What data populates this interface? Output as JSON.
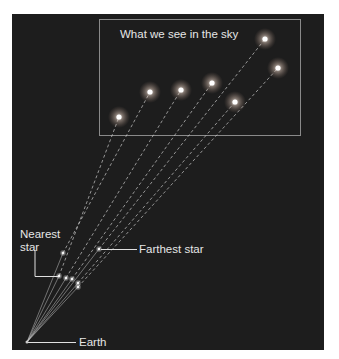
{
  "title": "What we see in the sky",
  "labels": {
    "nearest": [
      "Nearest",
      "star"
    ],
    "farthest": "Farthest star",
    "earth": "Earth"
  },
  "colors": {
    "background": "#1d1d1d",
    "line": "#cfcfcf",
    "box": "#8a8a8a",
    "star": "#ffffff"
  },
  "earth": {
    "x": 27,
    "y": 342
  },
  "stars": [
    {
      "name": "star-a",
      "near": {
        "x": 59,
        "y": 276
      },
      "sky": {
        "x": 119,
        "y": 117
      },
      "nearest": true
    },
    {
      "name": "star-b",
      "near": {
        "x": 63,
        "y": 253
      },
      "sky": {
        "x": 150,
        "y": 92
      }
    },
    {
      "name": "star-c",
      "near": {
        "x": 66,
        "y": 278
      },
      "sky": {
        "x": 181,
        "y": 90
      }
    },
    {
      "name": "star-d",
      "near": {
        "x": 72,
        "y": 279
      },
      "sky": {
        "x": 212,
        "y": 83
      }
    },
    {
      "name": "star-e",
      "near": {
        "x": 78,
        "y": 283
      },
      "sky": {
        "x": 235,
        "y": 102
      }
    },
    {
      "name": "star-f",
      "near": {
        "x": 78,
        "y": 287
      },
      "sky": {
        "x": 278,
        "y": 68
      }
    },
    {
      "name": "star-g",
      "near": {
        "x": 99,
        "y": 249
      },
      "sky": {
        "x": 265,
        "y": 39
      },
      "farthest": true
    }
  ]
}
